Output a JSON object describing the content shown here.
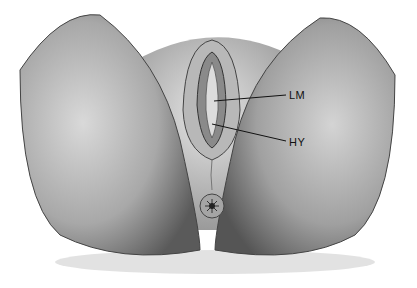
{
  "figure": {
    "labels": [
      {
        "id": "lm",
        "text": "LM",
        "x": 289,
        "y": 90
      },
      {
        "id": "hy",
        "text": "HY",
        "x": 289,
        "y": 136
      }
    ]
  }
}
